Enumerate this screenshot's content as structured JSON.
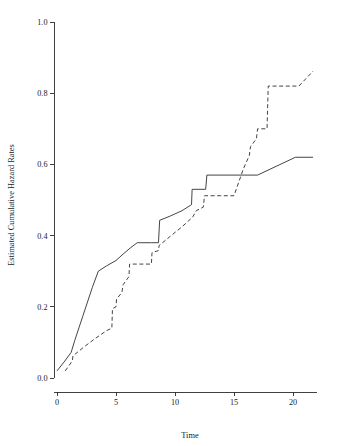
{
  "chart_data": {
    "type": "line",
    "title": "",
    "xlabel": "Time",
    "ylabel": "Estimated Cumulative Hazard Rates",
    "xlim": [
      0,
      22
    ],
    "ylim": [
      0.0,
      1.0
    ],
    "xticks": [
      0,
      5,
      10,
      15,
      20
    ],
    "xtick_labels": [
      "0",
      "5",
      "10",
      "15",
      "20"
    ],
    "yticks": [
      0.0,
      0.2,
      0.4,
      0.6,
      0.8,
      1.0
    ],
    "ytick_labels": [
      "0.0",
      "0.2",
      "0.4",
      "0.6",
      "0.8",
      "1.0"
    ],
    "grid": false,
    "legend": "none",
    "series": [
      {
        "name": "solid-curve",
        "style": "solid",
        "color": "#3a3a3a",
        "x": [
          0.0,
          0.6,
          1.2,
          1.5,
          2.2,
          3.0,
          3.5,
          4.2,
          5.0,
          5.6,
          6.2,
          6.8,
          8.0,
          8.6,
          8.7,
          9.6,
          10.6,
          11.4,
          11.45,
          12.6,
          12.7,
          17.0,
          20.2,
          21.7
        ],
        "y": [
          0.02,
          0.045,
          0.072,
          0.105,
          0.175,
          0.255,
          0.3,
          0.315,
          0.33,
          0.348,
          0.365,
          0.38,
          0.38,
          0.38,
          0.443,
          0.455,
          0.47,
          0.487,
          0.53,
          0.53,
          0.57,
          0.57,
          0.62,
          0.62
        ]
      },
      {
        "name": "dashed-curve",
        "style": "dashed",
        "color": "#3a3a3a",
        "x": [
          0.7,
          1.3,
          1.35,
          2.2,
          3.2,
          4.2,
          4.65,
          4.7,
          5.0,
          5.05,
          5.5,
          5.6,
          6.1,
          6.15,
          7.0,
          8.0,
          8.05,
          8.6,
          8.65,
          9.6,
          10.6,
          11.5,
          11.8,
          12.4,
          12.5,
          15.0,
          15.8,
          16.3,
          16.4,
          16.9,
          17.0,
          17.8,
          17.9,
          20.5,
          21.7
        ],
        "y": [
          0.02,
          0.048,
          0.062,
          0.085,
          0.11,
          0.133,
          0.14,
          0.195,
          0.2,
          0.222,
          0.24,
          0.262,
          0.285,
          0.32,
          0.32,
          0.32,
          0.352,
          0.358,
          0.372,
          0.398,
          0.425,
          0.452,
          0.47,
          0.48,
          0.512,
          0.512,
          0.588,
          0.625,
          0.65,
          0.672,
          0.7,
          0.7,
          0.82,
          0.82,
          0.862
        ]
      }
    ]
  }
}
